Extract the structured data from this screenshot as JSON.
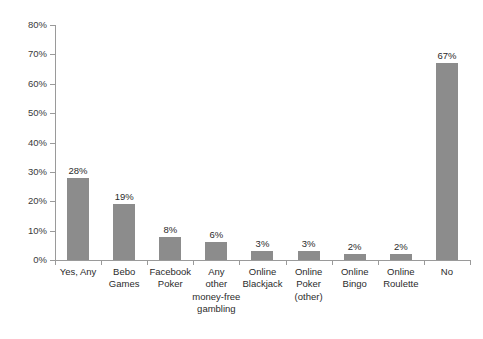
{
  "chart_data": {
    "type": "bar",
    "title": "",
    "subtitle": "",
    "xlabel": "",
    "ylabel": "",
    "ylim": [
      0,
      80
    ],
    "ytick_labels": [
      "80%",
      "70%",
      "60%",
      "50%",
      "40%",
      "30%",
      "20%",
      "10%",
      "0%"
    ],
    "ytick_values": [
      80,
      70,
      60,
      50,
      40,
      30,
      20,
      10,
      0
    ],
    "grid": false,
    "legend": false,
    "categories": [
      "Yes, Any",
      "Bebo Games",
      "Facebook Poker",
      "Any other money-free gambling",
      "Online Blackjack",
      "Online Poker (other)",
      "Online Bingo",
      "Online Roulette",
      "No"
    ],
    "category_lines": [
      [
        "Yes, Any"
      ],
      [
        "Bebo",
        "Games"
      ],
      [
        "Facebook",
        "Poker"
      ],
      [
        "Any",
        "other",
        "money-free",
        "gambling"
      ],
      [
        "Online",
        "Blackjack"
      ],
      [
        "Online",
        "Poker",
        "(other)"
      ],
      [
        "Online",
        "Bingo"
      ],
      [
        "Online",
        "Roulette"
      ],
      [
        "No"
      ]
    ],
    "values": [
      28,
      19,
      8,
      6,
      3,
      3,
      2,
      2,
      67
    ],
    "value_labels": [
      "28%",
      "19%",
      "8%",
      "6%",
      "3%",
      "3%",
      "2%",
      "2%",
      "67%"
    ],
    "bar_color": "#8c8c8c",
    "axis_color": "#9a9a9a",
    "text_color": "#2b2b2b",
    "background_color": "#ffffff"
  }
}
